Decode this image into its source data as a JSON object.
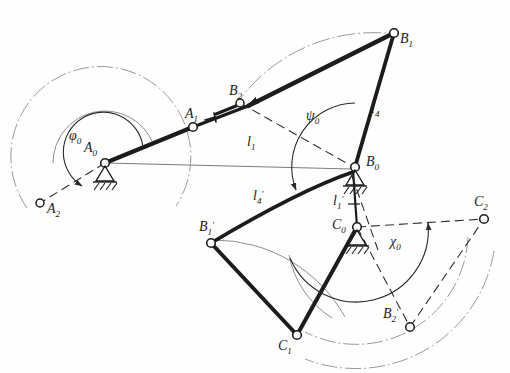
{
  "figure": {
    "type": "kinematic-linkage-diagram",
    "title": "",
    "background_color": "#fefefe",
    "ink_color": "#1c1c1c",
    "thin_color": "#8a8a8a"
  },
  "joints": [
    {
      "id": "A0",
      "label": "A",
      "sub": "0",
      "x": 105,
      "y": 163,
      "kind": "ground-pivot",
      "label_dx": -17,
      "label_dy": -13
    },
    {
      "id": "A1",
      "label": "A",
      "sub": "1",
      "x": 193,
      "y": 127,
      "kind": "pin",
      "label_dx": -6,
      "label_dy": -11
    },
    {
      "id": "A2",
      "label": "A",
      "sub": "2",
      "x": 40,
      "y": 203,
      "kind": "pin",
      "label_dx": 7,
      "label_dy": 9
    },
    {
      "id": "B0",
      "label": "B",
      "sub": "0",
      "x": 355,
      "y": 167,
      "kind": "ground-pivot",
      "label_dx": 9,
      "label_dy": -3
    },
    {
      "id": "B1",
      "label": "B",
      "sub": "1",
      "x": 394,
      "y": 33,
      "kind": "pin",
      "label_dx": 8,
      "label_dy": 8
    },
    {
      "id": "B2",
      "label": "B",
      "sub": "2",
      "x": 240,
      "y": 103,
      "kind": "pin",
      "label_dx": -4,
      "label_dy": -10
    },
    {
      "id": "C0",
      "label": "C",
      "sub": "0",
      "x": 357,
      "y": 227,
      "kind": "ground-pivot",
      "label_dx": -20,
      "label_dy": -2
    },
    {
      "id": "C1",
      "label": "C",
      "sub": "1",
      "x": 297,
      "y": 335,
      "kind": "pin",
      "label_dx": -17,
      "label_dy": 12
    },
    {
      "id": "C2",
      "label": "C",
      "sub": "2",
      "x": 484,
      "y": 219,
      "kind": "pin",
      "label_dx": -3,
      "label_dy": -11
    },
    {
      "id": "B1p",
      "label": "B",
      "sub": "1",
      "prime": "'",
      "x": 211,
      "y": 243,
      "kind": "pin",
      "label_dx": -5,
      "label_dy": -11
    },
    {
      "id": "B2p",
      "label": "B",
      "sub": "2",
      "prime": "'",
      "x": 410,
      "y": 327,
      "kind": "pin",
      "label_dx": -22,
      "label_dy": -4
    }
  ],
  "links": [
    {
      "id": "crank-A0-A1",
      "from": "A0",
      "to": "A1",
      "style": "heavy",
      "note": "input crank position 1"
    },
    {
      "id": "coupler-A1-B1",
      "from": "A1",
      "to": "B1",
      "style": "heavy",
      "note": "coupler to B1"
    },
    {
      "id": "rocker-B0-B1",
      "from": "B0",
      "to": "B1",
      "style": "heavy",
      "note": "output rocker l4"
    },
    {
      "id": "coupler-B2-B1",
      "from": "B2",
      "to": "B1",
      "style": "heavy",
      "note": "coupler second position"
    },
    {
      "id": "rocker-B0-B1p",
      "from": "B0",
      "to": "B1p",
      "style": "heavy",
      "note": "lower rocker l4-prime"
    },
    {
      "id": "coupler-B1p-C1",
      "from": "B1p",
      "to": "C1",
      "style": "heavy"
    },
    {
      "id": "rocker-C0-C1",
      "from": "C0",
      "to": "C1",
      "style": "heavy"
    },
    {
      "id": "frame-B0-C0",
      "from": "B0",
      "to": "C0",
      "style": "heavy",
      "note": "fixed link l1-prime"
    },
    {
      "id": "dash-A0-A2",
      "from": "A0",
      "to": "A2",
      "style": "dashed"
    },
    {
      "id": "dash-A0-B0",
      "from": "A0",
      "to": "B0",
      "style": "thin",
      "note": "frame line l1"
    },
    {
      "id": "dash-B2-B0",
      "from": "B2",
      "to": "B0",
      "style": "dashed"
    },
    {
      "id": "dash-C0-B2p",
      "from": "C0",
      "to": "B2p",
      "style": "dashed"
    },
    {
      "id": "dash-B2p-C2",
      "from": "B2p",
      "to": "C2",
      "style": "dashed"
    },
    {
      "id": "dash-C0-C2",
      "from": "C0",
      "to": "C2",
      "style": "dashed"
    }
  ],
  "dimension_labels": [
    {
      "id": "l1",
      "text": "l",
      "sub": "1",
      "prime": "",
      "x": 252,
      "y": 146
    },
    {
      "id": "l4",
      "text": "l",
      "sub": "4",
      "prime": "",
      "x": 375,
      "y": 110
    },
    {
      "id": "l4p",
      "text": "l",
      "sub": "4",
      "prime": "'",
      "x": 258,
      "y": 198
    },
    {
      "id": "l1p",
      "text": "l",
      "sub": "1",
      "prime": "'",
      "x": 340,
      "y": 202
    }
  ],
  "angle_labels": [
    {
      "id": "phi0",
      "glyph": "φ",
      "sub": "0",
      "x": 75,
      "y": 138,
      "note": "input crank swing angle at A0"
    },
    {
      "id": "psi0",
      "glyph": "ψ",
      "sub": "0",
      "x": 313,
      "y": 117,
      "note": "output rocker swing angle at B0"
    },
    {
      "id": "chi0",
      "glyph": "χ",
      "sub": "0",
      "x": 397,
      "y": 242,
      "note": "output swing angle at C0"
    }
  ],
  "arcs": [
    {
      "id": "arc-A-outer",
      "cx": 105,
      "cy": 163,
      "r": 90,
      "start_deg": 150,
      "end_deg": 382,
      "style": "dashdot"
    },
    {
      "id": "arc-A-inner",
      "cx": 105,
      "cy": 163,
      "r": 52,
      "start_deg": 180,
      "end_deg": 338,
      "style": "thin"
    },
    {
      "id": "arc-phi",
      "cx": 105,
      "cy": 163,
      "r": 38,
      "start_deg": 180,
      "end_deg": 338,
      "style": "thin-arrow"
    },
    {
      "id": "arc-B-top",
      "cx": 355,
      "cy": 167,
      "r": 168,
      "start_deg": 200,
      "end_deg": 253,
      "style": "dashdot"
    },
    {
      "id": "arc-psi",
      "cx": 355,
      "cy": 167,
      "r": 66,
      "start_deg": 182,
      "end_deg": 253,
      "style": "thin-arrow2"
    },
    {
      "id": "arc-B0-lower",
      "cx": 355,
      "cy": 167,
      "r": 150,
      "start_deg": 95,
      "end_deg": 160,
      "style": "thin"
    },
    {
      "id": "arc-chi",
      "cx": 357,
      "cy": 227,
      "r": 72,
      "start_deg": 0,
      "end_deg": 62,
      "style": "thin-arrow"
    },
    {
      "id": "arc-C-mid",
      "cx": 357,
      "cy": 227,
      "r": 112,
      "start_deg": 5,
      "end_deg": 118,
      "style": "dashdot"
    },
    {
      "id": "arc-C-outer",
      "cx": 357,
      "cy": 227,
      "r": 140,
      "start_deg": 10,
      "end_deg": 112,
      "style": "dashdot"
    }
  ],
  "ground_symbol": {
    "name": "fixed-support-hatching",
    "count": 3
  },
  "notes": {
    "diagram_kind": "four-bar linkage synthesis figure with two coupled mechanisms sharing frame B0-C0"
  }
}
